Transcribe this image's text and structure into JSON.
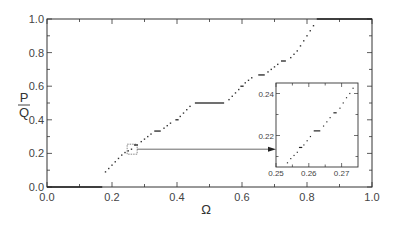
{
  "chart_data": {
    "type": "scatter",
    "title": "",
    "xlabel": "Ω",
    "ylabel": "P/Q",
    "ylabel_numerator": "P",
    "ylabel_denominator": "Q",
    "xlim": [
      0.0,
      1.0
    ],
    "ylim": [
      0.0,
      1.0
    ],
    "grid": false,
    "legend": null,
    "x_ticks": [
      "0.0",
      "0.2",
      "0.4",
      "0.6",
      "0.8",
      "1.0"
    ],
    "y_ticks": [
      "0.0",
      "0.2",
      "0.4",
      "0.6",
      "0.8",
      "1.0"
    ],
    "plateaus": [
      {
        "ratio": "0/1",
        "y": 0.0,
        "x_start": 0.0,
        "x_end": 0.17
      },
      {
        "ratio": "1/4",
        "y": 0.25,
        "x_start": 0.27,
        "x_end": 0.28
      },
      {
        "ratio": "1/3",
        "y": 0.333,
        "x_start": 0.33,
        "x_end": 0.35
      },
      {
        "ratio": "2/5",
        "y": 0.4,
        "x_start": 0.395,
        "x_end": 0.405
      },
      {
        "ratio": "1/2",
        "y": 0.5,
        "x_start": 0.455,
        "x_end": 0.545
      },
      {
        "ratio": "3/5",
        "y": 0.6,
        "x_start": 0.595,
        "x_end": 0.605
      },
      {
        "ratio": "2/3",
        "y": 0.667,
        "x_start": 0.65,
        "x_end": 0.67
      },
      {
        "ratio": "3/4",
        "y": 0.75,
        "x_start": 0.72,
        "x_end": 0.735
      },
      {
        "ratio": "1/1",
        "y": 1.0,
        "x_start": 0.83,
        "x_end": 1.0
      }
    ],
    "staircase_points": [
      [
        0.18,
        0.09
      ],
      [
        0.19,
        0.11
      ],
      [
        0.2,
        0.13
      ],
      [
        0.21,
        0.15
      ],
      [
        0.22,
        0.17
      ],
      [
        0.23,
        0.19
      ],
      [
        0.24,
        0.205
      ],
      [
        0.25,
        0.215
      ],
      [
        0.26,
        0.225
      ],
      [
        0.27,
        0.25
      ],
      [
        0.29,
        0.27
      ],
      [
        0.3,
        0.285
      ],
      [
        0.31,
        0.3
      ],
      [
        0.32,
        0.315
      ],
      [
        0.36,
        0.35
      ],
      [
        0.37,
        0.365
      ],
      [
        0.38,
        0.38
      ],
      [
        0.41,
        0.42
      ],
      [
        0.42,
        0.44
      ],
      [
        0.43,
        0.46
      ],
      [
        0.44,
        0.48
      ],
      [
        0.56,
        0.52
      ],
      [
        0.57,
        0.54
      ],
      [
        0.58,
        0.56
      ],
      [
        0.59,
        0.58
      ],
      [
        0.61,
        0.62
      ],
      [
        0.62,
        0.635
      ],
      [
        0.63,
        0.65
      ],
      [
        0.68,
        0.685
      ],
      [
        0.69,
        0.7
      ],
      [
        0.7,
        0.715
      ],
      [
        0.71,
        0.73
      ],
      [
        0.75,
        0.77
      ],
      [
        0.76,
        0.79
      ],
      [
        0.77,
        0.81
      ],
      [
        0.78,
        0.84
      ],
      [
        0.79,
        0.87
      ],
      [
        0.8,
        0.9
      ],
      [
        0.81,
        0.93
      ],
      [
        0.82,
        0.96
      ]
    ],
    "zoom_box": {
      "x_center": 0.262,
      "y_center": 0.225,
      "label": "magnified region"
    },
    "inset": {
      "type": "scatter",
      "xlim": [
        0.25,
        0.275
      ],
      "ylim": [
        0.205,
        0.245
      ],
      "x_ticks": [
        "0.25",
        "0.26",
        "0.27"
      ],
      "y_ticks": [
        "0.22",
        "0.24"
      ],
      "plateaus": [
        {
          "ratio": "2/9",
          "y": 0.2222,
          "x_start": 0.2615,
          "x_end": 0.2635
        },
        {
          "ratio": "3/13",
          "y": 0.2308,
          "x_start": 0.2675,
          "x_end": 0.2685
        },
        {
          "ratio": "1/5-ish",
          "y": 0.2143,
          "x_start": 0.257,
          "x_end": 0.258
        }
      ],
      "points": [
        [
          0.2535,
          0.207
        ],
        [
          0.2545,
          0.209
        ],
        [
          0.2555,
          0.2105
        ],
        [
          0.2565,
          0.212
        ],
        [
          0.2585,
          0.2155
        ],
        [
          0.2595,
          0.2175
        ],
        [
          0.2605,
          0.2195
        ],
        [
          0.2645,
          0.2245
        ],
        [
          0.2655,
          0.2265
        ],
        [
          0.2665,
          0.2285
        ],
        [
          0.2695,
          0.233
        ],
        [
          0.2705,
          0.2355
        ],
        [
          0.2715,
          0.238
        ],
        [
          0.2725,
          0.24
        ],
        [
          0.2735,
          0.2425
        ]
      ]
    }
  }
}
